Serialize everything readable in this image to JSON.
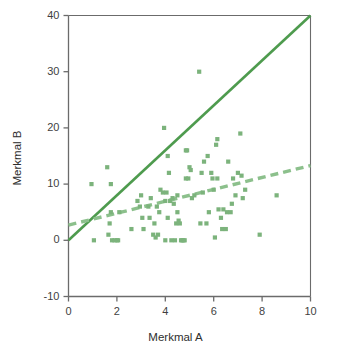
{
  "chart_data": {
    "type": "scatter",
    "title": "",
    "xlabel": "Merkmal A",
    "ylabel": "Merkmal B",
    "xlim": [
      0,
      10
    ],
    "ylim": [
      -10,
      40
    ],
    "xticks": [
      0,
      2,
      4,
      6,
      8,
      10
    ],
    "yticks": [
      -10,
      0,
      10,
      20,
      30,
      40
    ],
    "xtick_labels": [
      "0",
      "2",
      "4",
      "6",
      "8",
      "10"
    ],
    "ytick_labels": [
      "-10",
      "0",
      "10",
      "20",
      "30",
      "40"
    ],
    "grid": false,
    "legend": "none",
    "marker": "square",
    "marker_color": "#7cb37c",
    "points": [
      [
        0.95,
        10.0
      ],
      [
        1.05,
        0.0
      ],
      [
        1.6,
        13.0
      ],
      [
        1.65,
        1.0
      ],
      [
        1.7,
        3.0
      ],
      [
        1.75,
        10.0
      ],
      [
        1.75,
        5.0
      ],
      [
        1.8,
        0.0
      ],
      [
        1.9,
        0.0
      ],
      [
        2.0,
        0.0
      ],
      [
        2.05,
        0.0
      ],
      [
        2.1,
        5.0
      ],
      [
        2.6,
        2.0
      ],
      [
        2.85,
        7.0
      ],
      [
        2.95,
        6.0
      ],
      [
        3.0,
        8.0
      ],
      [
        3.05,
        4.0
      ],
      [
        3.1,
        2.0
      ],
      [
        3.3,
        6.0
      ],
      [
        3.35,
        4.0
      ],
      [
        3.4,
        7.5
      ],
      [
        3.5,
        1.0
      ],
      [
        3.55,
        3.0
      ],
      [
        3.6,
        0.5
      ],
      [
        3.65,
        6.0
      ],
      [
        3.7,
        1.0
      ],
      [
        3.75,
        5.0
      ],
      [
        3.8,
        9.0
      ],
      [
        3.9,
        8.5
      ],
      [
        3.95,
        20.0
      ],
      [
        4.0,
        0.0
      ],
      [
        4.0,
        7.0
      ],
      [
        4.05,
        8.5
      ],
      [
        4.1,
        15.0
      ],
      [
        4.1,
        4.0
      ],
      [
        4.15,
        12.0
      ],
      [
        4.2,
        7.0
      ],
      [
        4.25,
        0.0
      ],
      [
        4.3,
        7.5
      ],
      [
        4.35,
        6.5
      ],
      [
        4.4,
        0.0
      ],
      [
        4.45,
        3.0
      ],
      [
        4.5,
        8.0
      ],
      [
        4.5,
        5.0
      ],
      [
        4.55,
        3.5
      ],
      [
        4.6,
        3.0
      ],
      [
        4.65,
        0.0
      ],
      [
        4.7,
        0.0
      ],
      [
        4.75,
        0.0
      ],
      [
        4.8,
        0.0
      ],
      [
        4.85,
        11.0
      ],
      [
        4.85,
        16.0
      ],
      [
        4.9,
        16.0
      ],
      [
        4.95,
        11.0
      ],
      [
        5.0,
        13.0
      ],
      [
        5.05,
        12.5
      ],
      [
        5.1,
        7.5
      ],
      [
        5.2,
        8.0
      ],
      [
        5.4,
        30.0
      ],
      [
        5.45,
        3.0
      ],
      [
        5.5,
        12.0
      ],
      [
        5.55,
        8.5
      ],
      [
        5.6,
        14.0
      ],
      [
        5.7,
        3.0
      ],
      [
        5.75,
        15.0
      ],
      [
        5.8,
        5.0
      ],
      [
        5.9,
        12.0
      ],
      [
        5.95,
        11.0
      ],
      [
        6.0,
        9.0
      ],
      [
        6.05,
        0.5
      ],
      [
        6.1,
        17.0
      ],
      [
        6.15,
        18.0
      ],
      [
        6.15,
        11.0
      ],
      [
        6.2,
        5.5
      ],
      [
        6.3,
        4.0
      ],
      [
        6.35,
        2.0
      ],
      [
        6.4,
        5.5
      ],
      [
        6.5,
        2.0
      ],
      [
        6.55,
        5.0
      ],
      [
        6.6,
        14.0
      ],
      [
        6.7,
        5.0
      ],
      [
        6.75,
        6.5
      ],
      [
        6.8,
        11.0
      ],
      [
        6.9,
        8.0
      ],
      [
        7.0,
        12.0
      ],
      [
        7.1,
        19.0
      ],
      [
        7.15,
        11.5
      ],
      [
        7.2,
        7.5
      ],
      [
        7.3,
        9.0
      ],
      [
        7.9,
        1.0
      ],
      [
        8.6,
        8.0
      ]
    ],
    "lines": [
      {
        "name": "identity-line",
        "style": "solid",
        "color": "#4e9b4e",
        "width": 2.6,
        "x0": 0.0,
        "y0": 0.0,
        "x1": 10.0,
        "y1": 40.0,
        "slope": 4.0,
        "intercept": 0.0
      },
      {
        "name": "regression-line",
        "style": "dashed",
        "color": "#8cc08c",
        "width": 3.4,
        "x0": 0.0,
        "y0": 2.7,
        "x1": 10.0,
        "y1": 13.3,
        "slope": 1.06,
        "intercept": 2.7
      }
    ]
  },
  "axes": {
    "x_title": "Merkmal A",
    "y_title": "Merkmal B"
  },
  "colors": {
    "axis": "#6b6b6b",
    "text": "#3a3a3a",
    "marker": "#7cb37c",
    "solid_line": "#4e9b4e",
    "dashed_line": "#8cc08c",
    "background": "#ffffff"
  }
}
